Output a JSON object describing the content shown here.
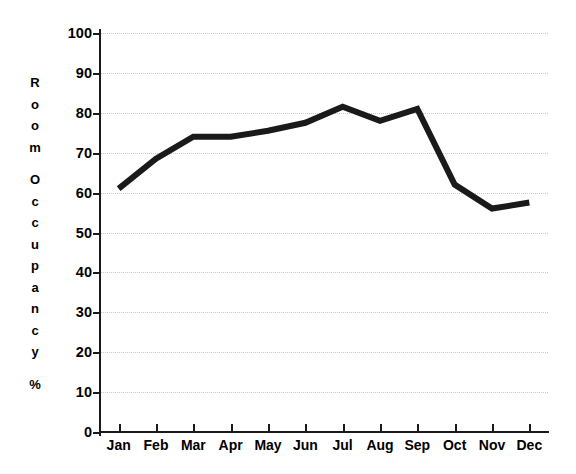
{
  "chart_data": {
    "type": "line",
    "title": "",
    "xlabel": "",
    "ylabel": "Room Occupancy %",
    "categories": [
      "Jan",
      "Feb",
      "Mar",
      "Apr",
      "May",
      "Jun",
      "Jul",
      "Aug",
      "Sep",
      "Oct",
      "Nov",
      "Dec"
    ],
    "values": [
      61,
      68.5,
      74,
      74,
      75.5,
      77.5,
      81.5,
      78,
      81,
      62,
      56,
      57.5
    ],
    "series": [
      {
        "name": "Room Occupancy",
        "values": [
          61,
          68.5,
          74,
          74,
          75.5,
          77.5,
          81.5,
          78,
          81,
          62,
          56,
          57.5
        ]
      }
    ],
    "ylim": [
      0,
      100
    ],
    "yticks": [
      0,
      10,
      20,
      30,
      40,
      50,
      60,
      70,
      80,
      90,
      100
    ],
    "ytick_labels": [
      "0",
      "10",
      "20",
      "30",
      "40",
      "50",
      "60",
      "70",
      "80",
      "90",
      "100"
    ],
    "grid": true,
    "grid_axis": "y",
    "legend": false,
    "legend_position": "none",
    "line_color": "#1a1a1a",
    "line_width": 6,
    "background_color": "#ffffff",
    "grid_color": "#c9c9c9",
    "axis_color": "#1a1a1a"
  },
  "ylabel_chars": [
    "R",
    "o",
    "o",
    "m",
    "",
    "O",
    "c",
    "c",
    "u",
    "p",
    "a",
    "n",
    "c",
    "y",
    "",
    "%"
  ]
}
